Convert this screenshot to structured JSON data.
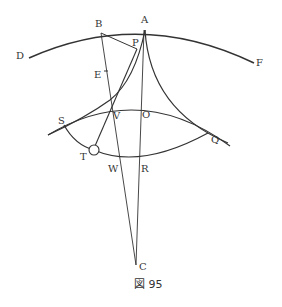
{
  "figure": {
    "caption": "図 95",
    "labels": {
      "A": "A",
      "B": "B",
      "P": "P",
      "D": "D",
      "F": "F",
      "E": "E",
      "S": "S",
      "V": "V",
      "O": "O",
      "Q": "Q",
      "T": "T",
      "W": "W",
      "R": "R",
      "C": "C"
    },
    "colors": {
      "stroke": "#333333",
      "background": "#ffffff"
    }
  }
}
